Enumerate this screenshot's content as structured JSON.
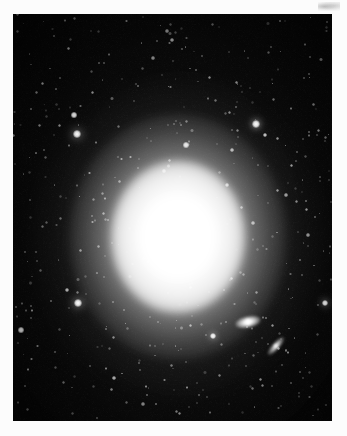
{
  "image": {
    "kind": "astronomical-photograph",
    "subject": "bright elliptical galaxy with surrounding star field",
    "medium": "black-and-white photographic plate scan",
    "plate": {
      "left": 13,
      "top": 14,
      "width": 319,
      "height": 407,
      "background_color": "#050505",
      "border_color": "#fcfcfc"
    },
    "scan_artifact": {
      "present": true,
      "location": "top-right margin",
      "color": "#9a9a9a"
    }
  },
  "galaxy": {
    "label": "main-elliptical-galaxy",
    "center_x": 178,
    "center_y": 237,
    "core_color": "#ffffff",
    "halo_color": "#8a8a8a",
    "orientation": "slightly elongated vertically",
    "axis_ratio": 0.85,
    "halo_radius_x": 108,
    "halo_radius_y": 122
  },
  "companions": [
    {
      "label": "companion-galaxy-lenticular",
      "x": 248,
      "y": 322,
      "rx": 13,
      "ry": 6,
      "rotation": -12,
      "brightness": "bright",
      "color": "#ffffff"
    },
    {
      "label": "companion-galaxy-edge-on",
      "x": 276,
      "y": 346,
      "rx": 12,
      "ry": 4,
      "rotation": -48,
      "brightness": "moderate",
      "color": "#efefef"
    }
  ],
  "bright_stars": [
    {
      "x": 77,
      "y": 134,
      "r": 4.2,
      "b": 1.0
    },
    {
      "x": 74,
      "y": 115,
      "r": 2.6,
      "b": 0.92
    },
    {
      "x": 78,
      "y": 303,
      "r": 4.0,
      "b": 1.0
    },
    {
      "x": 67,
      "y": 290,
      "r": 2.4,
      "b": 0.7
    },
    {
      "x": 21,
      "y": 330,
      "r": 2.6,
      "b": 0.88
    },
    {
      "x": 256,
      "y": 124,
      "r": 3.6,
      "b": 1.0
    },
    {
      "x": 325,
      "y": 303,
      "r": 3.4,
      "b": 1.0
    },
    {
      "x": 213,
      "y": 336,
      "r": 3.0,
      "b": 0.98
    },
    {
      "x": 186,
      "y": 145,
      "r": 2.6,
      "b": 0.9
    },
    {
      "x": 265,
      "y": 135,
      "r": 2.0,
      "b": 0.78
    },
    {
      "x": 232,
      "y": 150,
      "r": 1.8,
      "b": 0.7
    },
    {
      "x": 227,
      "y": 185,
      "r": 2.0,
      "b": 0.72
    },
    {
      "x": 253,
      "y": 223,
      "r": 1.8,
      "b": 0.66
    },
    {
      "x": 286,
      "y": 195,
      "r": 1.6,
      "b": 0.62
    },
    {
      "x": 308,
      "y": 235,
      "r": 1.6,
      "b": 0.6
    },
    {
      "x": 300,
      "y": 260,
      "r": 1.4,
      "b": 0.55
    },
    {
      "x": 291,
      "y": 165,
      "r": 1.5,
      "b": 0.58
    },
    {
      "x": 167,
      "y": 31,
      "r": 1.6,
      "b": 0.55
    },
    {
      "x": 172,
      "y": 40,
      "r": 1.8,
      "b": 0.62
    },
    {
      "x": 153,
      "y": 58,
      "r": 1.6,
      "b": 0.56
    },
    {
      "x": 196,
      "y": 70,
      "r": 1.4,
      "b": 0.5
    },
    {
      "x": 209,
      "y": 77,
      "r": 1.5,
      "b": 0.52
    },
    {
      "x": 99,
      "y": 63,
      "r": 1.4,
      "b": 0.48
    },
    {
      "x": 60,
      "y": 78,
      "r": 1.3,
      "b": 0.45
    },
    {
      "x": 44,
      "y": 150,
      "r": 1.3,
      "b": 0.45
    },
    {
      "x": 30,
      "y": 200,
      "r": 1.2,
      "b": 0.42
    },
    {
      "x": 36,
      "y": 252,
      "r": 1.3,
      "b": 0.44
    },
    {
      "x": 55,
      "y": 352,
      "r": 1.4,
      "b": 0.46
    },
    {
      "x": 114,
      "y": 378,
      "r": 1.8,
      "b": 0.7
    },
    {
      "x": 90,
      "y": 366,
      "r": 1.3,
      "b": 0.44
    },
    {
      "x": 143,
      "y": 404,
      "r": 1.6,
      "b": 0.55
    },
    {
      "x": 199,
      "y": 395,
      "r": 1.4,
      "b": 0.48
    },
    {
      "x": 262,
      "y": 385,
      "r": 1.5,
      "b": 0.5
    },
    {
      "x": 300,
      "y": 372,
      "r": 1.4,
      "b": 0.46
    },
    {
      "x": 318,
      "y": 130,
      "r": 1.5,
      "b": 0.52
    },
    {
      "x": 310,
      "y": 57,
      "r": 1.4,
      "b": 0.48
    },
    {
      "x": 271,
      "y": 47,
      "r": 1.3,
      "b": 0.44
    },
    {
      "x": 236,
      "y": 107,
      "r": 1.4,
      "b": 0.5
    },
    {
      "x": 164,
      "y": 171,
      "r": 1.6,
      "b": 0.62
    },
    {
      "x": 200,
      "y": 205,
      "r": 1.5,
      "b": 0.58
    },
    {
      "x": 148,
      "y": 262,
      "r": 1.4,
      "b": 0.52
    },
    {
      "x": 190,
      "y": 287,
      "r": 1.5,
      "b": 0.55
    },
    {
      "x": 124,
      "y": 310,
      "r": 1.4,
      "b": 0.5
    },
    {
      "x": 103,
      "y": 213,
      "r": 1.5,
      "b": 0.54
    }
  ],
  "faint_star_count": 420,
  "palette": {
    "plate_black": "#050505",
    "paper_white": "#fcfcfc",
    "star_white": "#ffffff",
    "halo_gray": "#8a8a8a"
  }
}
